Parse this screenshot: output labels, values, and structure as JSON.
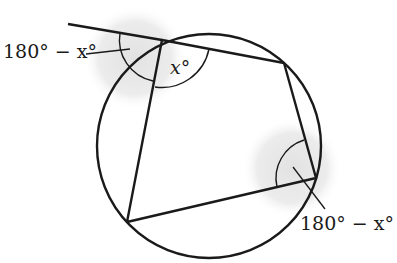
{
  "diagram": {
    "labels": {
      "interior_angle": "x°",
      "exterior_angle": "180° − x°",
      "opposite_angle": "180° − x°"
    },
    "colors": {
      "stroke": "#1a1a1a",
      "shade": "#e6e6e6",
      "background": "#ffffff"
    },
    "circle": {
      "cx": 209,
      "cy": 146,
      "r": 112
    },
    "vertices": {
      "A": [
        162,
        40
      ],
      "B": [
        284,
        63
      ],
      "C": [
        316,
        178
      ],
      "D": [
        127,
        222
      ]
    },
    "extension_line_start": [
      68,
      24
    ]
  }
}
